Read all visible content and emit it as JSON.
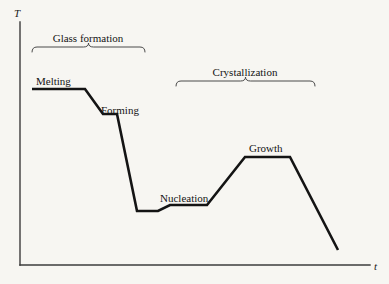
{
  "figure": {
    "background_color": "#f7f6f2",
    "curve_color": "#141414",
    "axis_color": "#3c3c3c",
    "brace_color": "#4a4a4a"
  },
  "axes": {
    "y_label": "T",
    "x_label": "t",
    "y_axis": {
      "x": 20,
      "y_top": 22,
      "y_bottom": 265
    },
    "x_axis": {
      "y": 265,
      "x_left": 20,
      "x_right": 370
    }
  },
  "braces": [
    {
      "id": "glass-formation",
      "label": "Glass formation",
      "x_start": 32,
      "x_end": 145,
      "y": 47,
      "label_x": 88,
      "label_y": 33
    },
    {
      "id": "crystallization",
      "label": "Crystallization",
      "x_start": 176,
      "x_end": 315,
      "y": 81,
      "label_x": 245,
      "label_y": 67
    }
  ],
  "curve_labels": [
    {
      "id": "melting",
      "text": "Melting",
      "x": 36,
      "y": 76
    },
    {
      "id": "forming",
      "text": "Forming",
      "x": 101,
      "y": 105
    },
    {
      "id": "nucleation",
      "text": "Nucleation",
      "x": 160,
      "y": 193
    },
    {
      "id": "growth",
      "text": "Growth",
      "x": 249,
      "y": 143
    }
  ],
  "chart_data": {
    "type": "line",
    "xlabel": "t",
    "ylabel": "T",
    "grid": false,
    "legend": null,
    "axis_ranges": {
      "x": [
        20,
        370
      ],
      "y_pixel": [
        22,
        265
      ]
    },
    "annotations": [
      "Glass formation",
      "Crystallization",
      "Melting",
      "Forming",
      "Nucleation",
      "Growth"
    ],
    "series": [
      {
        "name": "Temperature schedule",
        "points": [
          [
            32,
            89
          ],
          [
            85,
            89
          ],
          [
            103,
            114
          ],
          [
            117,
            114
          ],
          [
            137,
            211
          ],
          [
            158,
            211
          ],
          [
            170,
            205
          ],
          [
            207,
            205
          ],
          [
            245,
            157
          ],
          [
            290,
            157
          ],
          [
            338,
            250
          ]
        ],
        "stages": [
          {
            "stage": "Melting",
            "x_from": 32,
            "x_to": 85,
            "level": "high",
            "type": "hold"
          },
          {
            "stage": "cooling",
            "x_from": 85,
            "x_to": 103,
            "type": "ramp-down"
          },
          {
            "stage": "Forming",
            "x_from": 103,
            "x_to": 117,
            "level": "mid-high",
            "type": "hold"
          },
          {
            "stage": "quench",
            "x_from": 117,
            "x_to": 137,
            "type": "ramp-down"
          },
          {
            "stage": "low-hold",
            "x_from": 137,
            "x_to": 158,
            "level": "lowest",
            "type": "hold"
          },
          {
            "stage": "reheat",
            "x_from": 158,
            "x_to": 170,
            "type": "ramp-up"
          },
          {
            "stage": "Nucleation",
            "x_from": 170,
            "x_to": 207,
            "level": "low",
            "type": "hold"
          },
          {
            "stage": "heat-up",
            "x_from": 207,
            "x_to": 245,
            "type": "ramp-up"
          },
          {
            "stage": "Growth",
            "x_from": 245,
            "x_to": 290,
            "level": "mid",
            "type": "hold"
          },
          {
            "stage": "final-cool",
            "x_from": 290,
            "x_to": 338,
            "type": "ramp-down"
          }
        ]
      }
    ]
  }
}
